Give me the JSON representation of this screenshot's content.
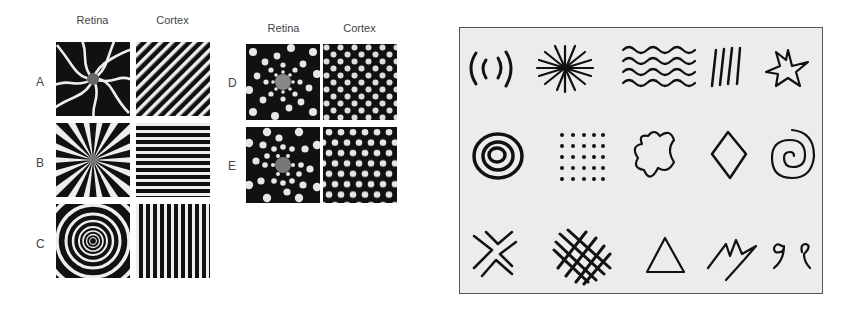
{
  "figure_left": {
    "group1": {
      "column_headers": [
        "Retina",
        "Cortex"
      ],
      "rows": [
        {
          "label": "A",
          "retina_pattern": "spiral-arms",
          "cortex_pattern": "diagonal-stripes"
        },
        {
          "label": "B",
          "retina_pattern": "radial-funnel",
          "cortex_pattern": "horizontal-stripes"
        },
        {
          "label": "C",
          "retina_pattern": "concentric-rings",
          "cortex_pattern": "vertical-stripes"
        }
      ]
    },
    "group2": {
      "column_headers": [
        "Retina",
        "Cortex"
      ],
      "rows": [
        {
          "label": "D",
          "retina_pattern": "radial-checkerboard",
          "cortex_pattern": "square-lattice"
        },
        {
          "label": "E",
          "retina_pattern": "radial-dot-lattice",
          "cortex_pattern": "hexagonal-lattice"
        }
      ]
    }
  },
  "figure_right": {
    "title": "",
    "glyph_rows": [
      [
        "nested-arcs",
        "radiating-star",
        "wavy-lines",
        "parallel-slashes",
        "jagged-star"
      ],
      [
        "concentric-circles",
        "dot-grid",
        "blob",
        "diamond",
        "spiral"
      ],
      [
        "double-x",
        "crosshatch-lattice",
        "triangle",
        "zigzag-bolt",
        "hooks"
      ]
    ]
  }
}
